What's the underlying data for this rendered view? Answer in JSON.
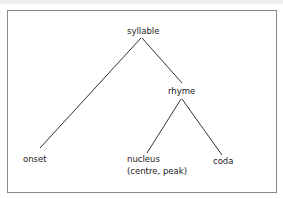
{
  "diagram": {
    "type": "tree",
    "nodes": {
      "root": {
        "label": "syllable"
      },
      "rhyme": {
        "label": "rhyme"
      },
      "onset": {
        "label": "onset"
      },
      "nucleus": {
        "label": "nucleus",
        "sublabel": "(centre, peak)"
      },
      "coda": {
        "label": "coda"
      }
    },
    "edges": [
      [
        "syllable",
        "onset"
      ],
      [
        "syllable",
        "rhyme"
      ],
      [
        "rhyme",
        "nucleus"
      ],
      [
        "rhyme",
        "coda"
      ]
    ],
    "colors": {
      "line": "#333333",
      "text": "#222222",
      "border": "#8a8a8a"
    }
  }
}
